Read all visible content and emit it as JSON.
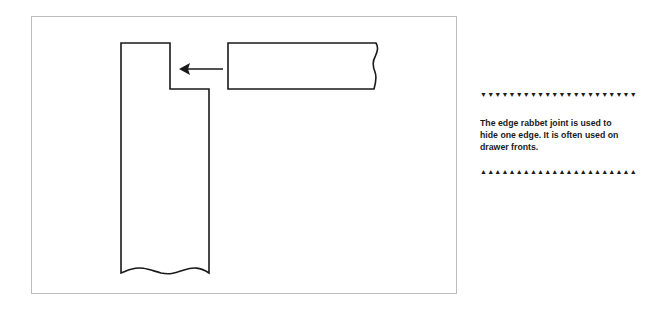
{
  "diagram": {
    "title": "Edge rabbet joint",
    "parts": [
      {
        "name": "vertical-board",
        "description": "Board with rabbet cut along top edge"
      },
      {
        "name": "horizontal-board",
        "description": "Board fitting into rabbet"
      },
      {
        "name": "arrow",
        "direction": "left"
      }
    ],
    "stroke_color": "#1a1a1a",
    "frame_color": "#bdbdbd"
  },
  "sidebar": {
    "top_ornament": "▼▼▼▼▼▼▼▼▼▼▼▼▼▼▼▼▼▼▼▼▼▼",
    "caption": "The edge rabbet joint is used to hide one edge.  It is often used on drawer fronts.",
    "bottom_ornament": "▲▲▲▲▲▲▲▲▲▲▲▲▲▲▲▲▲▲▲▲▲▲"
  }
}
